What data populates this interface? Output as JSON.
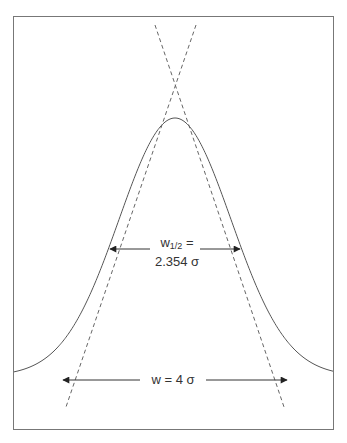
{
  "diagram": {
    "type": "gaussian-peak-width",
    "frame": {
      "x": 13,
      "y": 16,
      "width": 320,
      "height": 414,
      "stroke": "#777777"
    },
    "curve": {
      "peak_x": 175,
      "peak_y": 118,
      "baseline_y": 376,
      "sigma_px": 56,
      "stroke": "#555555"
    },
    "tangents": [
      {
        "x1": 155,
        "y1": 25,
        "x2": 284,
        "y2": 407
      },
      {
        "x1": 196,
        "y1": 25,
        "x2": 66,
        "y2": 407
      }
    ],
    "half_width_label": {
      "main": "w",
      "sub": "1/2",
      "suffix": " =",
      "line2": "2.354 σ"
    },
    "base_width_label": "w = 4 σ",
    "colors": {
      "line": "#555555",
      "dash": "#666666",
      "arrow": "#222222",
      "text": "#333333"
    }
  }
}
